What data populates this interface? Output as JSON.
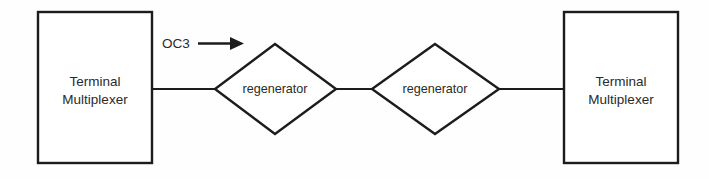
{
  "diagram": {
    "background_color": "#fefefe",
    "line_color": "#1c1c1c",
    "text_color": "#2a2a2a",
    "nodes": [
      {
        "id": "terminal-multiplexer-left",
        "shape": "rectangle",
        "line1": "Terminal",
        "line2": "Multiplexer"
      },
      {
        "id": "regenerator-1",
        "shape": "diamond",
        "label": "regenerator"
      },
      {
        "id": "regenerator-2",
        "shape": "diamond",
        "label": "regenerator"
      },
      {
        "id": "terminal-multiplexer-right",
        "shape": "rectangle",
        "line1": "Terminal",
        "line2": "Multiplexer"
      }
    ],
    "edge_labels": [
      {
        "id": "oc3-label",
        "text": "OC3",
        "arrow_direction": "right"
      }
    ]
  }
}
